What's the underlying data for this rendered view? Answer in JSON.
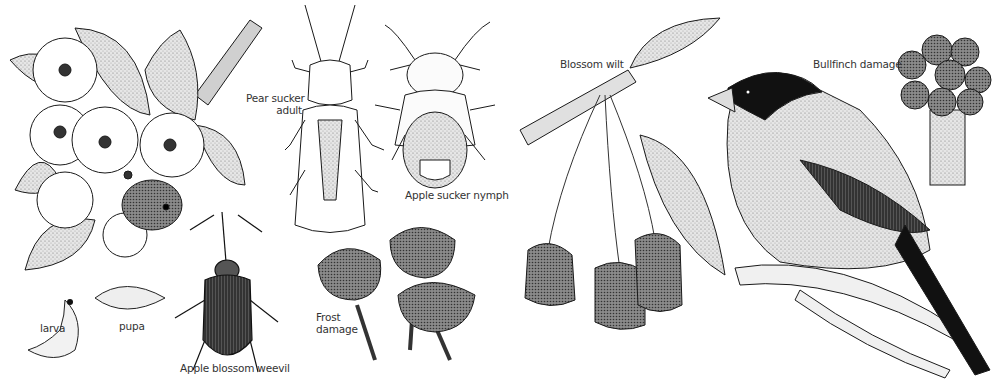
{
  "labels": {
    "larva": "larva",
    "pupa": "pupa",
    "apple_blossom_weevil": "Apple blossom weevil",
    "pear_sucker_line1": "Pear sucker",
    "pear_sucker_line2": "adult",
    "apple_sucker_nymph": "Apple sucker nymph",
    "frost_line1": "Frost",
    "frost_line2": "damage",
    "blossom_wilt": "Blossom wilt",
    "bullfinch_damage": "Bullfinch damage"
  },
  "colors": {
    "ink": "#1a1a1a",
    "shade_light": "#d9d9d9",
    "shade_mid": "#9a9a9a",
    "shade_dark": "#3a3a3a",
    "background": "#ffffff"
  }
}
